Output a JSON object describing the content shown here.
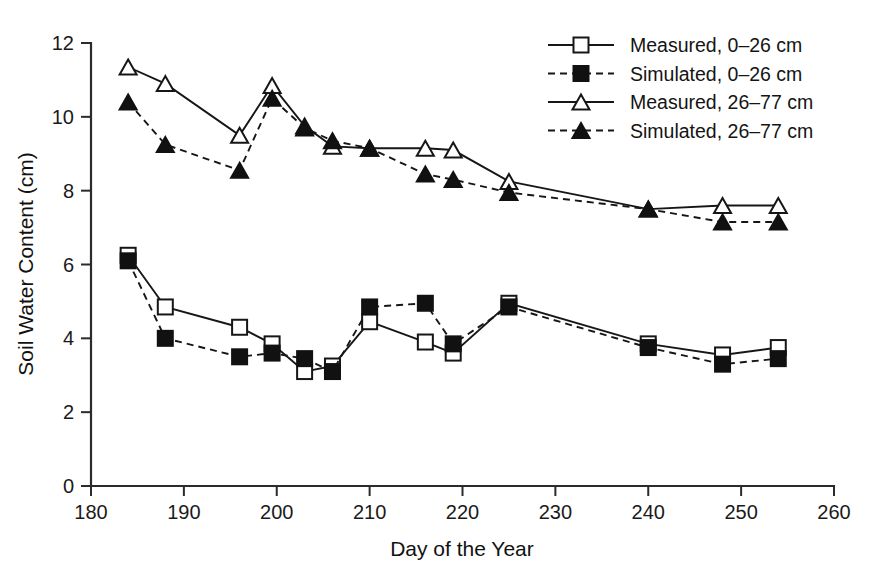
{
  "chart_data": {
    "type": "line",
    "title": "",
    "xlabel": "Day of the Year",
    "ylabel": "Soil Water Content (cm)",
    "xlim": [
      180,
      260
    ],
    "ylim": [
      0,
      12
    ],
    "xticks": [
      180,
      190,
      200,
      210,
      220,
      230,
      240,
      250,
      260
    ],
    "yticks": [
      0,
      2,
      4,
      6,
      8,
      10,
      12
    ],
    "grid": false,
    "legend_position": "top-right",
    "series": [
      {
        "name": "Measured, 0–26 cm",
        "marker": "open-square",
        "line": "solid",
        "x": [
          184,
          188,
          196,
          199.5,
          203,
          206,
          210,
          216,
          219,
          225,
          240,
          248,
          254
        ],
        "values": [
          6.25,
          4.85,
          4.3,
          3.85,
          3.1,
          3.25,
          4.45,
          3.9,
          3.6,
          4.95,
          3.85,
          3.55,
          3.75
        ]
      },
      {
        "name": "Simulated, 0–26 cm",
        "marker": "filled-square",
        "line": "dashed",
        "x": [
          184,
          188,
          196,
          199.5,
          203,
          206,
          210,
          216,
          219,
          225,
          240,
          248,
          254
        ],
        "values": [
          6.1,
          4.0,
          3.5,
          3.6,
          3.45,
          3.1,
          4.85,
          4.95,
          3.85,
          4.85,
          3.75,
          3.3,
          3.45
        ]
      },
      {
        "name": "Measured, 26–77 cm",
        "marker": "open-triangle",
        "line": "solid",
        "x": [
          184,
          188,
          196,
          199.5,
          203,
          206,
          210,
          216,
          219,
          225,
          240,
          248,
          254
        ],
        "values": [
          11.35,
          10.9,
          9.5,
          10.85,
          9.75,
          9.2,
          9.15,
          9.15,
          9.1,
          8.25,
          7.5,
          7.6,
          7.6
        ]
      },
      {
        "name": "Simulated, 26–77 cm",
        "marker": "filled-triangle",
        "line": "dashed",
        "x": [
          184,
          188,
          196,
          199.5,
          203,
          206,
          210,
          216,
          219,
          225,
          240,
          248,
          254
        ],
        "values": [
          10.4,
          9.25,
          8.55,
          10.5,
          9.7,
          9.35,
          9.15,
          8.45,
          8.3,
          7.95,
          7.5,
          7.15,
          7.15
        ]
      }
    ]
  },
  "legend": {
    "entries": [
      {
        "label": "Measured, 0–26 cm",
        "marker": "open-square",
        "line": "solid"
      },
      {
        "label": "Simulated, 0–26 cm",
        "marker": "filled-square",
        "line": "dashed"
      },
      {
        "label": "Measured, 26–77 cm",
        "marker": "open-triangle",
        "line": "solid"
      },
      {
        "label": "Simulated, 26–77 cm",
        "marker": "filled-triangle",
        "line": "dashed"
      }
    ]
  },
  "colors": {
    "ink": "#161616",
    "axis": "#2b2b2b",
    "background": "#ffffff"
  }
}
